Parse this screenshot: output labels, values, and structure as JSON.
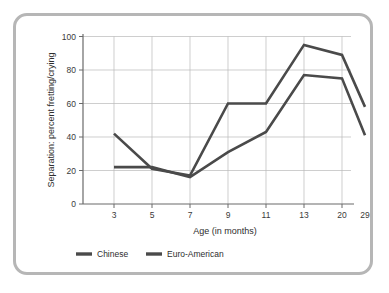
{
  "chart_data": {
    "type": "line",
    "title": "",
    "xlabel": "Age (in months)",
    "ylabel": "Separation: percent fretting/crying",
    "categories": [
      "3",
      "5",
      "7",
      "9",
      "11",
      "13",
      "20",
      "29"
    ],
    "x": [
      3,
      5,
      7,
      9,
      11,
      13,
      20,
      29
    ],
    "ylim": [
      0,
      100
    ],
    "yticks": [
      0,
      20,
      40,
      60,
      80,
      100
    ],
    "ytick_labels": [
      "0",
      "20",
      "40",
      "60",
      "80",
      "100"
    ],
    "grid": true,
    "legend_position": "bottom-left",
    "series": [
      {
        "name": "Chinese",
        "color": "#4a4a4a",
        "values": [
          22,
          22,
          16,
          31,
          43,
          77,
          75,
          41
        ]
      },
      {
        "name": "Euro-American",
        "color": "#4a4a4a",
        "values": [
          42,
          21,
          17,
          60,
          60,
          95,
          89,
          58
        ]
      }
    ]
  },
  "figure": {
    "frame_color": "#b6b6b6",
    "background": "#ffffff",
    "axis_color": "#6a6a6a",
    "grid_color": "#b9b9b9"
  },
  "legend": {
    "items": [
      {
        "label": "Chinese",
        "color": "#4a4a4a"
      },
      {
        "label": "Euro-American",
        "color": "#4a4a4a"
      }
    ]
  }
}
